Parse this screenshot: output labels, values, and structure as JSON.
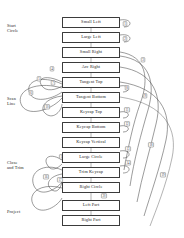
{
  "diagram": {
    "type": "flowchart",
    "background": "#ffffff",
    "line_color": "#4a4a4a",
    "box_border_color": "#3b3b3b",
    "text_color": "#1d1d1d",
    "stage_labels": [
      {
        "id": "start-circle",
        "text": "Start\nCircle",
        "x": 7,
        "y": 23
      },
      {
        "id": "scan-line",
        "text": "Scan\nLine",
        "x": 7,
        "y": 96
      },
      {
        "id": "close-trim",
        "text": "Close\nand Trim",
        "x": 7,
        "y": 160
      },
      {
        "id": "project",
        "text": "Project",
        "x": 7,
        "y": 209
      }
    ],
    "nodes": [
      {
        "id": "small-left",
        "label": "Small Left",
        "x": 62,
        "y": 17,
        "w": 58,
        "h": 11
      },
      {
        "id": "large-left",
        "label": "Large Left",
        "x": 62,
        "y": 32,
        "w": 58,
        "h": 11
      },
      {
        "id": "small-right",
        "label": "Small Right",
        "x": 62,
        "y": 47,
        "w": 58,
        "h": 11
      },
      {
        "id": "arc-right",
        "label": "Arc Right",
        "x": 62,
        "y": 62,
        "w": 58,
        "h": 11
      },
      {
        "id": "tangent-top",
        "label": "Tangent Top",
        "x": 62,
        "y": 77,
        "w": 58,
        "h": 11
      },
      {
        "id": "tangent-bottom",
        "label": "Tangent Bottom",
        "x": 62,
        "y": 92,
        "w": 58,
        "h": 11
      },
      {
        "id": "keycap-top",
        "label": "Keycap Top",
        "x": 62,
        "y": 107,
        "w": 58,
        "h": 11
      },
      {
        "id": "keycap-bottom",
        "label": "Keycap Bottom",
        "x": 62,
        "y": 122,
        "w": 58,
        "h": 11
      },
      {
        "id": "keycap-vertical",
        "label": "Keycap Vertical",
        "x": 62,
        "y": 137,
        "w": 58,
        "h": 11
      },
      {
        "id": "large-circle",
        "label": "Large Circle",
        "x": 62,
        "y": 152,
        "w": 58,
        "h": 11
      },
      {
        "id": "trim-keycap",
        "label": "Trim Keycap",
        "x": 62,
        "y": 167,
        "w": 58,
        "h": 11
      },
      {
        "id": "right-circle",
        "label": "Right Circle",
        "x": 62,
        "y": 182,
        "w": 58,
        "h": 11
      },
      {
        "id": "left-part",
        "label": "Left Part",
        "x": 62,
        "y": 200,
        "w": 58,
        "h": 11
      },
      {
        "id": "right-part",
        "label": "Right Part",
        "x": 62,
        "y": 215,
        "w": 58,
        "h": 11
      }
    ],
    "arc_numbers": [
      {
        "n": "1",
        "x": 125,
        "y": 24
      },
      {
        "n": "2",
        "x": 125,
        "y": 39
      },
      {
        "n": "3",
        "x": 143,
        "y": 60
      },
      {
        "n": "4",
        "x": 52,
        "y": 69
      },
      {
        "n": "5",
        "x": 39,
        "y": 79
      },
      {
        "n": "6",
        "x": 31,
        "y": 93
      },
      {
        "n": "7",
        "x": 53,
        "y": 83
      },
      {
        "n": "8",
        "x": 127,
        "y": 88
      },
      {
        "n": "9",
        "x": 145,
        "y": 96
      },
      {
        "n": "10",
        "x": 47,
        "y": 107
      },
      {
        "n": "11",
        "x": 127,
        "y": 110
      },
      {
        "n": "12",
        "x": 127,
        "y": 124
      },
      {
        "n": "13",
        "x": 128,
        "y": 149
      },
      {
        "n": "14",
        "x": 128,
        "y": 163
      },
      {
        "n": "15",
        "x": 62,
        "y": 157
      },
      {
        "n": "16",
        "x": 46,
        "y": 177
      },
      {
        "n": "17",
        "x": 60,
        "y": 180
      },
      {
        "n": "18",
        "x": 151,
        "y": 145
      },
      {
        "n": "19",
        "x": 163,
        "y": 175
      },
      {
        "n": "20",
        "x": 104,
        "y": 196
      }
    ]
  }
}
